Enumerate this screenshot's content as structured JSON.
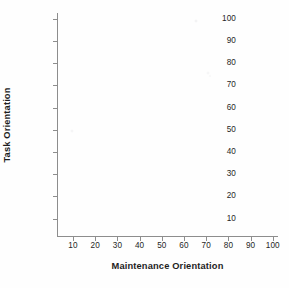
{
  "figure": {
    "background_color": "#fefefe",
    "axis_color": "#8d8d8d",
    "text_color": "#262626",
    "title_color": "#1d1d1d"
  },
  "chart_data": {
    "type": "scatter",
    "title": "",
    "subtitle": "",
    "xlabel": "Maintenance Orientation",
    "ylabel": "Task Orientation",
    "xlim": [
      0,
      105
    ],
    "ylim": [
      0,
      105
    ],
    "xticks": [
      10,
      20,
      30,
      40,
      50,
      60,
      70,
      80,
      90,
      100
    ],
    "yticks": [
      10,
      20,
      30,
      40,
      50,
      60,
      70,
      80,
      90,
      100
    ],
    "xticklabels": [
      "10",
      "20",
      "30",
      "40",
      "50",
      "60",
      "70",
      "80",
      "90",
      "100"
    ],
    "yticklabels": [
      "10",
      "20",
      "30",
      "40",
      "50",
      "60",
      "70",
      "80",
      "90",
      "100"
    ],
    "grid": false,
    "legend": null,
    "legend_position": "none",
    "annotations": [],
    "series": [
      {
        "name": "",
        "x": [],
        "y": []
      }
    ],
    "note": "Empty grid template: axes are drawn with labelled ticks but no data points, lines or markers are plotted."
  }
}
